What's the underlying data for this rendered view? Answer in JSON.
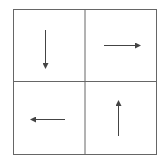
{
  "diagram": {
    "type": "2x2 grid with directional arrows",
    "colors": {
      "stroke": "#555555",
      "arrow": "#444444",
      "background": "#ffffff"
    },
    "cells": [
      {
        "position": "top-left",
        "arrow": "down"
      },
      {
        "position": "top-right",
        "arrow": "right"
      },
      {
        "position": "bottom-left",
        "arrow": "left"
      },
      {
        "position": "bottom-right",
        "arrow": "up"
      }
    ]
  }
}
